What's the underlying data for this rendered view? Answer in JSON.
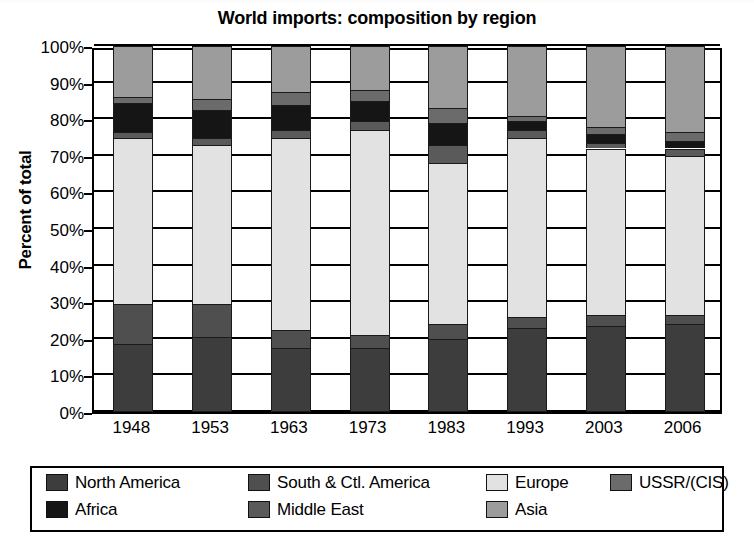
{
  "chart_data": {
    "type": "bar",
    "title": "World imports: composition by region",
    "xlabel": "",
    "ylabel": "Percent of total",
    "stacked": true,
    "percent": true,
    "grid": true,
    "legend_position": "bottom",
    "ylim": [
      0,
      100
    ],
    "y_ticks": [
      "0%",
      "10%",
      "20%",
      "30%",
      "40%",
      "50%",
      "60%",
      "70%",
      "80%",
      "90%",
      "100%"
    ],
    "y_tick_values": [
      0,
      10,
      20,
      30,
      40,
      50,
      60,
      70,
      80,
      90,
      100
    ],
    "categories": [
      "1948",
      "1953",
      "1963",
      "1973",
      "1983",
      "1993",
      "2003",
      "2006"
    ],
    "series": [
      {
        "name": "North America",
        "color": "#3d3d3d",
        "values": [
          18.5,
          20.5,
          17.5,
          17.5,
          20.0,
          23.0,
          23.5,
          24.0
        ]
      },
      {
        "name": "South & Ctl. America",
        "color": "#4f4f4f",
        "values": [
          11.0,
          9.0,
          5.0,
          3.5,
          4.0,
          3.0,
          3.0,
          2.5
        ]
      },
      {
        "name": "Europe",
        "color": "#e2e2e2",
        "values": [
          45.5,
          43.5,
          52.5,
          56.0,
          44.0,
          49.0,
          45.5,
          43.5
        ]
      },
      {
        "name": "Middle East",
        "color": "#5a5a5a",
        "values": [
          1.5,
          2.0,
          2.0,
          2.5,
          5.0,
          2.0,
          1.5,
          2.0
        ]
      },
      {
        "name": "Africa",
        "color": "#151515",
        "values": [
          8.0,
          7.5,
          7.0,
          5.5,
          6.0,
          2.5,
          2.5,
          2.0
        ]
      },
      {
        "name": "USSR/(CIS)",
        "color": "#6b6b6b",
        "values": [
          1.5,
          3.0,
          3.5,
          3.0,
          4.0,
          1.5,
          2.0,
          2.5
        ]
      },
      {
        "name": "Asia",
        "color": "#9c9c9c",
        "values": [
          14.0,
          14.5,
          12.5,
          12.0,
          17.0,
          19.0,
          22.0,
          23.5
        ]
      }
    ]
  },
  "legend": {
    "items": [
      {
        "label": "North America",
        "color": "#3d3d3d"
      },
      {
        "label": "South & Ctl. America",
        "color": "#4f4f4f"
      },
      {
        "label": "Europe",
        "color": "#e2e2e2"
      },
      {
        "label": "USSR/(CIS)",
        "color": "#6b6b6b"
      },
      {
        "label": "Africa",
        "color": "#151515"
      },
      {
        "label": "Middle East",
        "color": "#5a5a5a"
      },
      {
        "label": "Asia",
        "color": "#9c9c9c"
      }
    ]
  }
}
